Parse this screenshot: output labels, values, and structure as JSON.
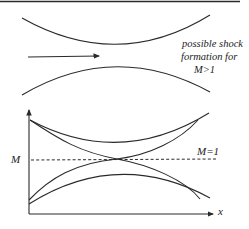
{
  "colors": {
    "stroke": "#2a2a2a",
    "background": "#ffffff"
  },
  "nozzle": {
    "flow_arrow": "flow-direction-arrow",
    "annotation": [
      "possible shock",
      "formation for",
      "M>1"
    ]
  },
  "graph": {
    "y_label": "M",
    "x_label": "x",
    "reference_line_label": "M=1",
    "reference_value": 1,
    "curves": [
      "subsonic-to-subsonic (upper, no crossing)",
      "supersonic-to-subsonic (through throat)",
      "subsonic-to-supersonic (through throat)",
      "subsonic-to-subsonic (lower, no crossing)"
    ]
  }
}
